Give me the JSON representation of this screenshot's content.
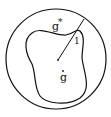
{
  "diagram": {
    "outer_region_label": "g",
    "outer_region_superscript": "*",
    "inner_region_label": "g",
    "inner_region_dot": "·",
    "radius_label": "1",
    "colors": {
      "stroke": "#111111",
      "background": "#ffffff"
    }
  }
}
